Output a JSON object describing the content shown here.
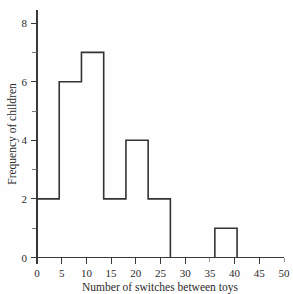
{
  "chart_data": {
    "type": "bar",
    "title": "",
    "subtitle": "",
    "xlabel": "Number of switches between toys",
    "ylabel": "Frequency of children",
    "categories": [
      "0-5",
      "5-10",
      "10-15",
      "15-20",
      "20-25",
      "25-30",
      "30-35",
      "35-40",
      "40-45",
      "45-50"
    ],
    "bin_edges": [
      0,
      5,
      10,
      15,
      20,
      25,
      30,
      35,
      40,
      45,
      50
    ],
    "bin_width": 5,
    "values": [
      2,
      6,
      7,
      2,
      4,
      2,
      0,
      0,
      1,
      0
    ],
    "x": [
      2.5,
      7.5,
      12.5,
      17.5,
      22.5,
      27.5,
      32.5,
      37.5,
      42.5,
      47.5
    ],
    "xlim": [
      0,
      50
    ],
    "ylim": [
      0,
      8
    ],
    "xticks": [
      0,
      5,
      10,
      15,
      20,
      25,
      30,
      35,
      40,
      45,
      50
    ],
    "xticklabels": [
      "0",
      "5",
      "10",
      "15",
      "20",
      "25",
      "30",
      "35",
      "40",
      "45",
      "50"
    ],
    "yticks": [
      0,
      2,
      4,
      6,
      8
    ],
    "yticklabels": [
      "0",
      "2",
      "4",
      "6",
      "8"
    ],
    "yticks_minor": [
      1,
      3,
      5,
      7
    ],
    "grid": false,
    "legend": false,
    "legend_position": "none",
    "bar_fill": "#ffffff",
    "bar_edge_color": "#333333",
    "axis_color": "#3a3a3a",
    "background": "#fefefe",
    "total_frequency": 24
  },
  "labels": {
    "x_axis_title": "Number of switches between toys",
    "y_axis_title": "Frequency of children"
  }
}
